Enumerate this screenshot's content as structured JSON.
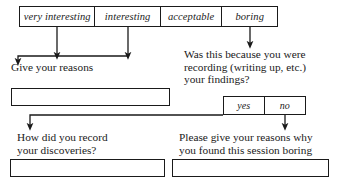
{
  "diagram": {
    "ink_color": "#1a1a1a",
    "background": "#ffffff"
  },
  "scale": {
    "name": "rating-scale",
    "options": [
      {
        "label": "very interesting"
      },
      {
        "label": "interesting"
      },
      {
        "label": "acceptable"
      },
      {
        "label": "boring"
      }
    ]
  },
  "branches": {
    "positive": {
      "prompt": "Give your reasons",
      "answer_value": "",
      "answer_placeholder": ""
    },
    "negative": {
      "prompt": "Was this because you were\nrecording (writing up, etc.)\nyour findings?",
      "options": [
        {
          "label": "yes"
        },
        {
          "label": "no"
        }
      ]
    },
    "yes_followup": {
      "prompt": "How did you record\nyour discoveries?",
      "answer_value": "",
      "answer_placeholder": ""
    },
    "no_followup": {
      "prompt": "Please give your reasons why\nyou found this session boring",
      "answer_value": "",
      "answer_placeholder": ""
    }
  },
  "connectors": [
    {
      "name": "very-interesting-to-give-reasons",
      "from": "very interesting",
      "to": "Give your reasons"
    },
    {
      "name": "interesting-to-give-reasons",
      "from": "interesting",
      "to": "Give your reasons"
    },
    {
      "name": "boring-to-was-this-because",
      "from": "boring",
      "to": "Was this because you were recording (writing up, etc.) your findings?"
    },
    {
      "name": "yes-to-how-did-you-record",
      "from": "yes",
      "to": "How did you record your discoveries?"
    },
    {
      "name": "no-to-please-give-reasons",
      "from": "no",
      "to": "Please give your reasons why you found this session boring"
    }
  ]
}
